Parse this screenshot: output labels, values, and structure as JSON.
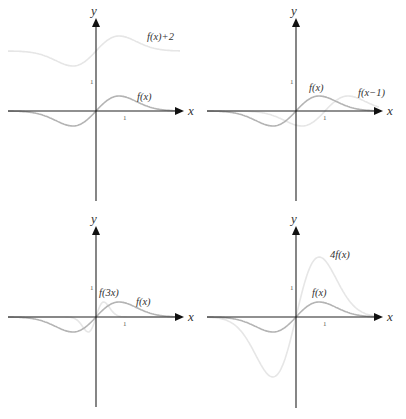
{
  "chart_data": [
    {
      "type": "line",
      "title": "",
      "xlabel": "x",
      "ylabel": "y",
      "ticks": {
        "x": [
          "1"
        ],
        "y": [
          "1"
        ]
      },
      "grid": false,
      "series": [
        {
          "name": "f(x)",
          "label": "f(x)",
          "color": "#b4b4b4",
          "transform": "none"
        },
        {
          "name": "f(x)+2",
          "label": "f(x)+2",
          "color": "#e6e6e6",
          "transform": "shift_up_2"
        }
      ]
    },
    {
      "type": "line",
      "title": "",
      "xlabel": "x",
      "ylabel": "y",
      "ticks": {
        "x": [
          "1"
        ],
        "y": [
          "1"
        ]
      },
      "grid": false,
      "series": [
        {
          "name": "f(x)",
          "label": "f(x)",
          "color": "#b4b4b4",
          "transform": "none"
        },
        {
          "name": "f(x-1)",
          "label": "f(x−1)",
          "color": "#e6e6e6",
          "transform": "shift_right_1"
        }
      ]
    },
    {
      "type": "line",
      "title": "",
      "xlabel": "x",
      "ylabel": "y",
      "ticks": {
        "x": [
          "1"
        ],
        "y": [
          "1"
        ]
      },
      "grid": false,
      "series": [
        {
          "name": "f(x)",
          "label": "f(x)",
          "color": "#b4b4b4",
          "transform": "none"
        },
        {
          "name": "f(3x)",
          "label": "f(3x)",
          "color": "#e6e6e6",
          "transform": "compress_x_3"
        }
      ]
    },
    {
      "type": "line",
      "title": "",
      "xlabel": "x",
      "ylabel": "y",
      "ticks": {
        "x": [
          "1"
        ],
        "y": [
          "1"
        ]
      },
      "grid": false,
      "series": [
        {
          "name": "f(x)",
          "label": "f(x)",
          "color": "#b4b4b4",
          "transform": "none"
        },
        {
          "name": "4f(x)",
          "label": "4f(x)",
          "color": "#e6e6e6",
          "transform": "scale_y_4"
        }
      ]
    }
  ],
  "base_function": {
    "description": "odd bump: peak ~0.5 at x~0.8, trough ~-0.5 at x~-0.8, decays to 0",
    "peak_x": 0.8,
    "peak_y": 0.5
  },
  "axes": {
    "x_label": "x",
    "y_label": "y",
    "x_tick": "1",
    "y_tick": "1"
  },
  "labels": {
    "p1": {
      "base": "f(x)",
      "transformed": "f(x)+2"
    },
    "p2": {
      "base": "f(x)",
      "transformed": "f(x−1)"
    },
    "p3": {
      "base": "f(x)",
      "transformed": "f(3x)"
    },
    "p4": {
      "base": "f(x)",
      "transformed": "4f(x)"
    }
  },
  "colors": {
    "axis": "#222222",
    "base_curve": "#b4b4b4",
    "transformed_curve": "#e6e6e6",
    "text": "#333333"
  }
}
